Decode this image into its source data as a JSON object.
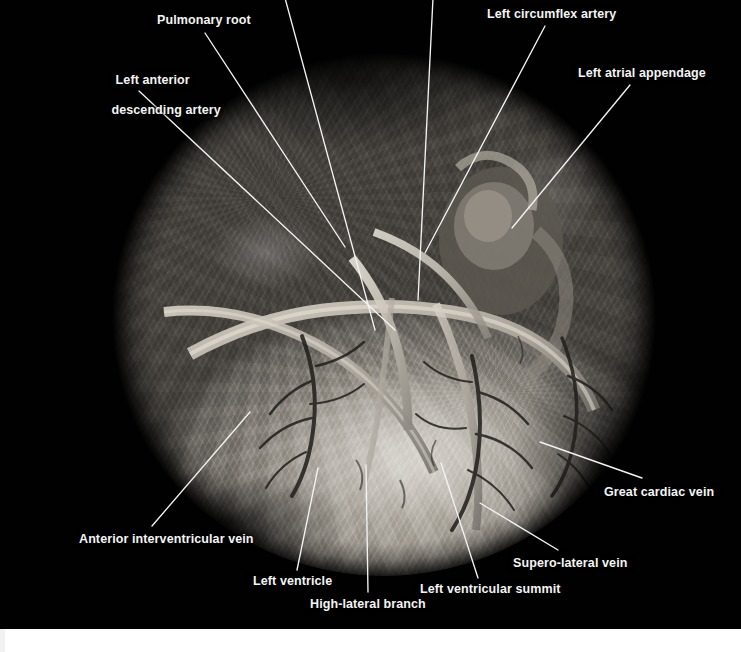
{
  "figure": {
    "type": "gross-anatomy-photograph",
    "view": "anterior / antero-lateral epicardial surface",
    "background_color": "#010101",
    "label_color": "#f4f4f4",
    "leader_line_color": "#f3f3f3",
    "footer_strip_color": "#ffffff"
  },
  "labels": [
    {
      "id": "pulmonary-root",
      "text": "Pulmonary root",
      "lines": [
        "Pulmonary root"
      ],
      "x": 157,
      "y": 13,
      "align": "left",
      "leader": {
        "x1": 205,
        "y1": 33,
        "x2": 345,
        "y2": 247
      }
    },
    {
      "id": "left-anterior-descending-artery",
      "text": "Left anterior descending artery",
      "lines": [
        "Left anterior",
        "descending artery"
      ],
      "x": 90,
      "y": 58,
      "align": "center",
      "width": 104,
      "leader": {
        "x1": 139,
        "y1": 91,
        "x2": 395,
        "y2": 330
      }
    },
    {
      "id": "left-circumflex-artery",
      "text": "Left circumflex artery",
      "lines": [
        "Left circumflex artery"
      ],
      "x": 487,
      "y": 7,
      "align": "left",
      "leader": {
        "x1": 545,
        "y1": 26,
        "x2": 425,
        "y2": 253
      }
    },
    {
      "id": "left-atrial-appendage",
      "text": "Left atrial appendage",
      "lines": [
        "Left atrial appendage"
      ],
      "x": 578,
      "y": 66,
      "align": "left",
      "leader": {
        "x1": 630,
        "y1": 85,
        "x2": 512,
        "y2": 228
      }
    },
    {
      "id": "great-cardiac-vein",
      "text": "Great cardiac vein",
      "lines": [
        "Great cardiac vein"
      ],
      "x": 604,
      "y": 485,
      "align": "left",
      "leader": {
        "x1": 642,
        "y1": 478,
        "x2": 540,
        "y2": 442
      }
    },
    {
      "id": "supero-lateral-vein",
      "text": "Supero-lateral vein",
      "lines": [
        "Supero-lateral vein"
      ],
      "x": 513,
      "y": 556,
      "align": "left",
      "leader": {
        "x1": 558,
        "y1": 550,
        "x2": 480,
        "y2": 503
      }
    },
    {
      "id": "left-ventricular-summit",
      "text": "Left ventricular summit",
      "lines": [
        "Left ventricular summit"
      ],
      "x": 420,
      "y": 582,
      "align": "left",
      "leader": {
        "x1": 478,
        "y1": 578,
        "x2": 441,
        "y2": 463
      }
    },
    {
      "id": "high-lateral-branch",
      "text": "High-lateral branch",
      "lines": [
        "High-lateral branch"
      ],
      "x": 310,
      "y": 597,
      "align": "left",
      "leader": {
        "x1": 368,
        "y1": 592,
        "x2": 366,
        "y2": 465
      }
    },
    {
      "id": "left-ventricle",
      "text": "Left ventricle",
      "lines": [
        "Left ventricle"
      ],
      "x": 253,
      "y": 574,
      "align": "left",
      "leader": {
        "x1": 297,
        "y1": 570,
        "x2": 318,
        "y2": 468
      }
    },
    {
      "id": "anterior-interventricular-vein",
      "text": "Anterior interventricular vein",
      "lines": [
        "Anterior interventricular vein"
      ],
      "x": 79,
      "y": 532,
      "align": "left",
      "leader": {
        "x1": 152,
        "y1": 526,
        "x2": 250,
        "y2": 412
      }
    },
    {
      "id": "unlabeled-leader-left",
      "text": "",
      "lines": [],
      "x": 0,
      "y": 0,
      "align": "left",
      "leader": {
        "x1": 285,
        "y1": -2,
        "x2": 375,
        "y2": 330
      }
    },
    {
      "id": "unlabeled-leader-right",
      "text": "",
      "lines": [],
      "x": 0,
      "y": 0,
      "align": "left",
      "leader": {
        "x1": 433,
        "y1": -2,
        "x2": 418,
        "y2": 300
      }
    }
  ],
  "specimen": {
    "shape": "circle",
    "center_x": 384,
    "center_y": 306,
    "radius_x": 278,
    "radius_y": 270
  }
}
